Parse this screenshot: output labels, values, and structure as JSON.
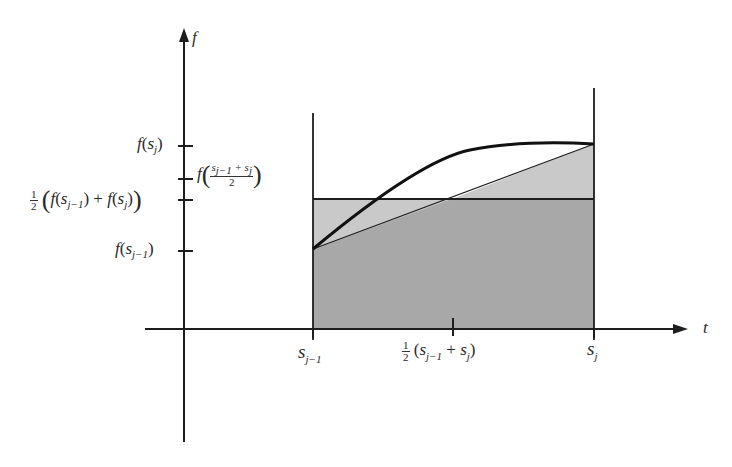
{
  "figure": {
    "axes": {
      "y_axis_label": "f",
      "x_axis_label": "t"
    },
    "y_tick_labels": {
      "f_sj": "f(s_j)",
      "f_mid": "f((s_{j-1}+s_j)/2)",
      "half_avg": "1/2 (f(s_{j-1}) + f(s_j))",
      "f_sj_minus_1": "f(s_{j-1})"
    },
    "x_tick_labels": {
      "s_j_minus_1": "s_{j-1}",
      "midpoint": "1/2 (s_{j-1} + s_j)",
      "s_j": "s_j"
    },
    "parts": {
      "f": "f",
      "open": "(",
      "close": ")",
      "s": "s",
      "sub_j": "j",
      "sub_jm1": "j−1",
      "plus": "+",
      "half_num": "1",
      "half_den": "2",
      "two": "2"
    },
    "colors": {
      "dark_fill": "#a9a9a9",
      "light_fill": "#cacaca",
      "stroke": "#1e1e1e",
      "background": "#ffffff"
    }
  }
}
